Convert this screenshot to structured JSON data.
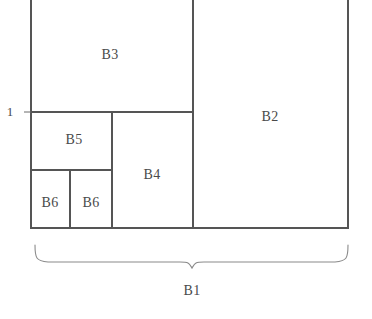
{
  "figure": {
    "type": "squared-rectangle-diagram",
    "stroke_color": "#555555",
    "brace_color": "#8a8a8a",
    "text_color": "#4a4a4a",
    "background_color": "#ffffff",
    "canvas": {
      "width": 372,
      "height": 319
    }
  },
  "blocks": [
    {
      "id": "B2",
      "label": "B2",
      "x": 270,
      "y": 117,
      "rect": {
        "x": 193,
        "y": -8,
        "w": 155,
        "h": 236
      }
    },
    {
      "id": "B3",
      "label": "B3",
      "x": 110,
      "y": 55,
      "rect": {
        "x": 31,
        "y": -8,
        "w": 162,
        "h": 120
      }
    },
    {
      "id": "B4",
      "label": "B4",
      "x": 152,
      "y": 175,
      "rect": {
        "x": 112,
        "y": 112,
        "w": 81,
        "h": 116
      }
    },
    {
      "id": "B5",
      "label": "B5",
      "x": 74,
      "y": 140,
      "rect": {
        "x": 31,
        "y": 112,
        "w": 81,
        "h": 58
      }
    },
    {
      "id": "B6a",
      "label": "B6",
      "x": 50,
      "y": 203,
      "rect": {
        "x": 31,
        "y": 170,
        "w": 39,
        "h": 58
      }
    },
    {
      "id": "B6b",
      "label": "B6",
      "x": 91,
      "y": 203,
      "rect": {
        "x": 70,
        "y": 170,
        "w": 42,
        "h": 58
      }
    }
  ],
  "dimensions": {
    "left_label": "1",
    "left_label_x": 10,
    "left_label_y": 111,
    "brace_label": "B1",
    "brace_label_x": 192,
    "brace_label_y": 291,
    "brace_left_x": 35,
    "brace_right_x": 348,
    "brace_top_y": 245,
    "brace_tip_y": 267
  }
}
